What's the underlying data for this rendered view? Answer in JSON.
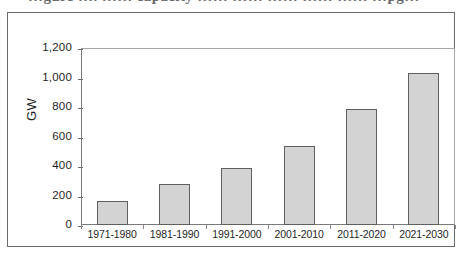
{
  "figure": {
    "caption_sliver": "…gure …. …… capacity …… …… …… …… …… …pg…"
  },
  "chart_data": {
    "type": "bar",
    "title": "",
    "subtitle": "",
    "xlabel": "",
    "ylabel": "GW",
    "categories": [
      "1971-1980",
      "1981-1990",
      "1991-2000",
      "2001-2010",
      "2011-2020",
      "2021-2030"
    ],
    "values": [
      160,
      280,
      385,
      535,
      785,
      1030
    ],
    "ylim": [
      0,
      1200
    ],
    "yticks": [
      0,
      200,
      400,
      600,
      800,
      1000,
      1200
    ],
    "ytick_labels": [
      "0",
      "200",
      "400",
      "600",
      "800",
      "1,000",
      "1,200"
    ],
    "grid": false,
    "legend": null,
    "colors": {
      "bar_fill": "#d3d3d3",
      "bar_border": "#5f5f5f",
      "axis": "#7a7a7a",
      "frame": "#6b6b6b",
      "text": "#1f1f1f",
      "background": "#ffffff"
    }
  }
}
